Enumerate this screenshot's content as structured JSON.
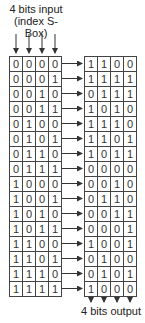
{
  "title": {
    "line1": "4 bits input",
    "line2": "(index S-Box)"
  },
  "footer": {
    "label": "4 bits output"
  },
  "input_rows": [
    [
      "0",
      "0",
      "0",
      "0"
    ],
    [
      "0",
      "0",
      "0",
      "1"
    ],
    [
      "0",
      "0",
      "1",
      "0"
    ],
    [
      "0",
      "0",
      "1",
      "1"
    ],
    [
      "0",
      "1",
      "0",
      "0"
    ],
    [
      "0",
      "1",
      "0",
      "1"
    ],
    [
      "0",
      "1",
      "1",
      "0"
    ],
    [
      "0",
      "1",
      "1",
      "1"
    ],
    [
      "1",
      "0",
      "0",
      "0"
    ],
    [
      "1",
      "0",
      "0",
      "1"
    ],
    [
      "1",
      "0",
      "1",
      "0"
    ],
    [
      "1",
      "0",
      "1",
      "1"
    ],
    [
      "1",
      "1",
      "0",
      "0"
    ],
    [
      "1",
      "1",
      "0",
      "1"
    ],
    [
      "1",
      "1",
      "1",
      "0"
    ],
    [
      "1",
      "1",
      "1",
      "1"
    ]
  ],
  "output_rows": [
    [
      "1",
      "1",
      "0",
      "0"
    ],
    [
      "1",
      "1",
      "1",
      "1"
    ],
    [
      "0",
      "1",
      "1",
      "1"
    ],
    [
      "1",
      "0",
      "1",
      "0"
    ],
    [
      "1",
      "1",
      "1",
      "0"
    ],
    [
      "1",
      "1",
      "0",
      "1"
    ],
    [
      "1",
      "0",
      "1",
      "1"
    ],
    [
      "0",
      "0",
      "0",
      "0"
    ],
    [
      "0",
      "0",
      "1",
      "0"
    ],
    [
      "0",
      "1",
      "1",
      "0"
    ],
    [
      "0",
      "0",
      "1",
      "1"
    ],
    [
      "0",
      "0",
      "0",
      "1"
    ],
    [
      "1",
      "0",
      "0",
      "1"
    ],
    [
      "0",
      "1",
      "0",
      "0"
    ],
    [
      "0",
      "1",
      "0",
      "1"
    ],
    [
      "1",
      "0",
      "0",
      "0"
    ]
  ],
  "colors": {
    "line": "#444444",
    "text": "#222222"
  }
}
